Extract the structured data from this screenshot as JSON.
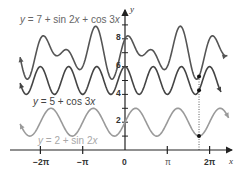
{
  "chart_data": {
    "type": "line",
    "title": "",
    "xlabel": "x",
    "ylabel": "y",
    "xlim": [
      -2.5,
      2.5
    ],
    "xlim_units": "multiples of pi",
    "ylim": [
      0,
      9
    ],
    "grid": false,
    "x_ticks": [
      {
        "value": -2,
        "label": "−2π"
      },
      {
        "value": -1,
        "label": "−π"
      },
      {
        "value": 0,
        "label": "0"
      },
      {
        "value": 1,
        "label": "π"
      },
      {
        "value": 2,
        "label": "2π"
      }
    ],
    "y_ticks": [
      {
        "value": 2,
        "label": "2"
      },
      {
        "value": 4,
        "label": "4"
      },
      {
        "value": 6,
        "label": "6"
      },
      {
        "value": 8,
        "label": "8"
      }
    ],
    "series": [
      {
        "name": "y = 7 + sin 2x + cos 3x",
        "expr": "7+sin(2x)+cos(3x)",
        "color": "#555555",
        "label_color": "#666666"
      },
      {
        "name": "y = 5 + cos 3x",
        "expr": "5+cos(3x)",
        "color": "#444444",
        "label_color": "#444444"
      },
      {
        "name": "y = 2 + sin 2x",
        "expr": "2+sin(2x)",
        "color": "#9a9a9a",
        "label_color": "#a8a8a8"
      }
    ],
    "annotations": {
      "dotted_vertical_at_x_pi": 1.75,
      "points": [
        {
          "x_pi": 1.75,
          "y": 1.0
        },
        {
          "x_pi": 1.75,
          "y": 4.29
        },
        {
          "x_pi": 1.75,
          "y": 5.29
        }
      ]
    }
  },
  "labels": {
    "top": {
      "prefix": "y",
      "text": " = 7 + sin 2",
      "x1": "x",
      "mid": " + cos 3",
      "x2": "x"
    },
    "middle": {
      "prefix": "y",
      "text": " = 5 + cos 3",
      "x1": "x"
    },
    "bottom": {
      "prefix": "y",
      "text": " = 2 + sin 2",
      "x1": "x"
    }
  },
  "axes": {
    "x": "x",
    "y": "y"
  },
  "ticks": {
    "x": [
      "−2π",
      "−π",
      "0",
      "π",
      "2π"
    ],
    "y": [
      "2",
      "4",
      "6",
      "8"
    ]
  }
}
